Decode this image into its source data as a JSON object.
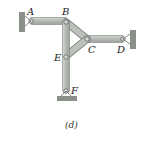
{
  "figure": {
    "caption": "(d)",
    "joints": {
      "A": "A",
      "B": "B",
      "C": "C",
      "D": "D",
      "E": "E",
      "F": "F"
    },
    "members": [
      "AB",
      "BE",
      "EF",
      "BC",
      "EC",
      "CD"
    ],
    "supports": [
      "A: pin to left wall",
      "D: pin to right wall",
      "F: pin to ground"
    ],
    "colors": {
      "member_fill": "#b8bdb8",
      "member_edge": "#7d827d",
      "support": "#8a8f8a",
      "text": "#222222"
    }
  }
}
